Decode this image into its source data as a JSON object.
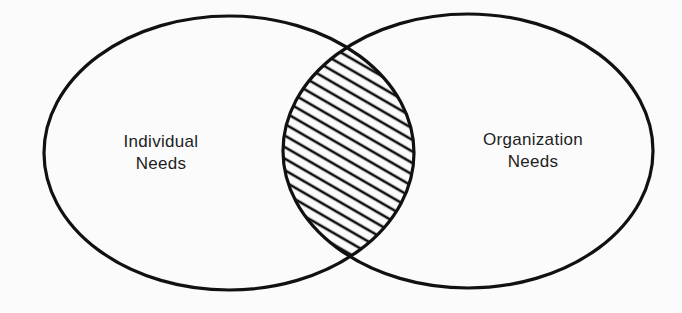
{
  "diagram": {
    "type": "venn",
    "sets": [
      {
        "id": "individual",
        "label_line1": "Individual",
        "label_line2": "Needs"
      },
      {
        "id": "organization",
        "label_line1": "Organization",
        "label_line2": "Needs"
      }
    ],
    "intersection": {
      "fill": "diagonal-hatch"
    },
    "colors": {
      "stroke": "#111111",
      "background": "#fbfbfb",
      "text": "#1e1e1e"
    }
  }
}
